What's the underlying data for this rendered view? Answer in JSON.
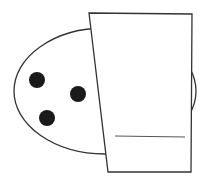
{
  "diagram": {
    "colors": {
      "stroke": "#333333",
      "dot_fill": "#1a1a1a",
      "line": "#555555",
      "background": "#ffffff"
    },
    "oval": {
      "cx": 105,
      "cy": 91,
      "rx": 91,
      "ry": 63
    },
    "dots": [
      {
        "cx": 37,
        "cy": 80,
        "r": 8
      },
      {
        "cx": 78,
        "cy": 94,
        "r": 8
      },
      {
        "cx": 47,
        "cy": 118,
        "r": 8
      }
    ],
    "rectangle": {
      "points": "89,13 192,14 191,172 108,172"
    },
    "inner_line": {
      "x1": 115,
      "y1": 136,
      "x2": 185,
      "y2": 137
    }
  }
}
